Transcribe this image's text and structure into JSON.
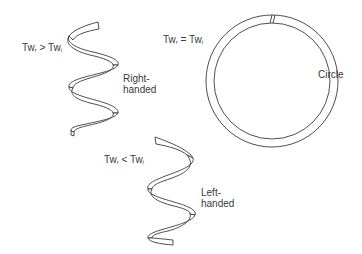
{
  "diagram": {
    "right_helix": {
      "relation": {
        "lhs": "Tw",
        "lhs_sub": "r",
        "op": ">",
        "rhs": "Tw",
        "rhs_sub": "i"
      },
      "label_line1": "Right-",
      "label_line2": "handed"
    },
    "circle": {
      "relation": {
        "lhs": "Tw",
        "lhs_sub": "r",
        "op": "=",
        "rhs": "Tw",
        "rhs_sub": "i"
      },
      "label": "Circle"
    },
    "left_helix": {
      "relation": {
        "lhs": "Tw",
        "lhs_sub": "r",
        "op": "<",
        "rhs": "Tw",
        "rhs_sub": "i"
      },
      "label_line1": "Left-",
      "label_line2": "handed"
    },
    "colors": {
      "stroke": "#3a3a3a",
      "background": "#ffffff"
    }
  }
}
